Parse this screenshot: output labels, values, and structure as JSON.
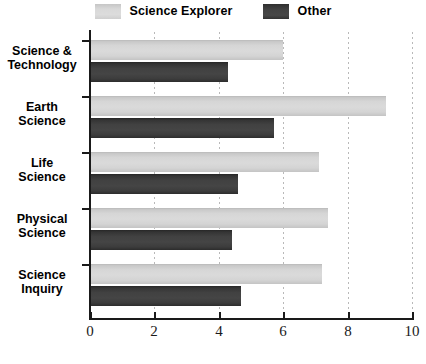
{
  "legend": {
    "position": "top-center",
    "entries": [
      {
        "label": "Science Explorer",
        "swatch": "light-gray-swatch",
        "color": "#d6d6d6"
      },
      {
        "label": "Other",
        "swatch": "dark-gray-swatch",
        "color": "#414141"
      }
    ]
  },
  "axis": {
    "x_ticks": [
      "0",
      "2",
      "4",
      "6",
      "8",
      "10"
    ]
  },
  "chart_data": {
    "type": "bar",
    "orientation": "horizontal",
    "title": "",
    "xlabel": "",
    "ylabel": "",
    "xlim": [
      0,
      10
    ],
    "xticks": [
      0,
      2,
      4,
      6,
      8,
      10
    ],
    "grid": true,
    "grid_axis": "x",
    "grid_style": "dotted",
    "legend_position": "top-center",
    "categories": [
      "Science & Technology",
      "Earth Science",
      "Life Science",
      "Physical Science",
      "Science Inquiry"
    ],
    "category_lines": [
      [
        "Science &",
        "Technology"
      ],
      [
        "Earth",
        "Science"
      ],
      [
        "Life",
        "Science"
      ],
      [
        "Physical",
        "Science"
      ],
      [
        "Science",
        "Inquiry"
      ]
    ],
    "series": [
      {
        "name": "Science Explorer",
        "color": "#d6d6d6",
        "values": [
          6.0,
          9.2,
          7.1,
          7.4,
          7.2
        ]
      },
      {
        "name": "Other",
        "color": "#414141",
        "values": [
          4.3,
          5.7,
          4.6,
          4.4,
          4.7
        ]
      }
    ]
  }
}
